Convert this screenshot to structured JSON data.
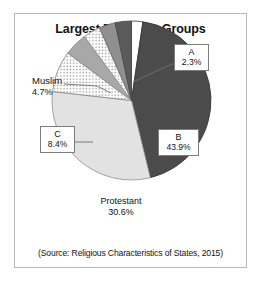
{
  "figure": {
    "title_line1": "Largest Religious Groups",
    "title_line2": "(Rwanda)",
    "source": "(Source: Religious Characteristics of States, 2015)",
    "border_color": "#b9b9b9",
    "background": "#ffffff"
  },
  "labels": {
    "a": {
      "name": "A",
      "value": "2.3%"
    },
    "b": {
      "name": "B",
      "value": "43.9%"
    },
    "c": {
      "name": "C",
      "value": "8.4%"
    },
    "muslim": {
      "name": "Muslim",
      "value": "4.7%"
    },
    "protestant": {
      "name": "Protestant",
      "value": "30.6%"
    }
  },
  "chart_data": {
    "type": "pie",
    "title": "Largest Religious Groups (Rwanda)",
    "subtitle": "(Rwanda)",
    "source": "(Source: Religious Characteristics of States, 2015)",
    "units": "percent",
    "total": 100,
    "legend": "none",
    "labels_position": "callout-boxes-and-leader-lines",
    "start_angle_deg": 0,
    "direction": "clockwise",
    "categories": [
      "A",
      "B",
      "Protestant",
      "C",
      "Muslim",
      "Other 1",
      "Other 2",
      "Other 3"
    ],
    "values": [
      2.3,
      43.9,
      30.6,
      8.4,
      4.7,
      3.5,
      3.3,
      3.3
    ],
    "slices": [
      {
        "label": "A",
        "value": 2.3,
        "display": "2.3%",
        "fill": "#fdfdfd",
        "stroke": "#4f4f4f",
        "pattern": "solid",
        "label_style": "boxed-callout",
        "label_anchor": "upper-right"
      },
      {
        "label": "B",
        "value": 43.9,
        "display": "43.9%",
        "fill": "#4b4b4b",
        "stroke": "#3a3a3a",
        "pattern": "solid",
        "label_style": "boxed-callout",
        "label_anchor": "inside-right"
      },
      {
        "label": "Protestant",
        "value": 30.6,
        "display": "30.6%",
        "fill": "#e2e2e2",
        "stroke": "#9a9a9a",
        "pattern": "solid",
        "label_style": "plain-inside",
        "label_anchor": "inside-bottom-left"
      },
      {
        "label": "C",
        "value": 8.4,
        "display": "8.4%",
        "fill": "#ffffff",
        "stroke": "#8f8f8f",
        "pattern": "dotted",
        "label_style": "boxed-callout",
        "label_anchor": "left"
      },
      {
        "label": "Muslim",
        "value": 4.7,
        "display": "4.7%",
        "fill": "#a8a8a8",
        "stroke": "#8a8a8a",
        "pattern": "solid",
        "label_style": "plain-leader-line",
        "label_anchor": "upper-left"
      },
      {
        "label": "Other 1",
        "value": 3.5,
        "display": "",
        "fill": "#ffffff",
        "stroke": "#8f8f8f",
        "pattern": "dotted",
        "label_style": "none",
        "label_anchor": "none"
      },
      {
        "label": "Other 2",
        "value": 3.3,
        "display": "",
        "fill": "#8f8f8f",
        "stroke": "#6e6e6e",
        "pattern": "solid",
        "label_style": "none",
        "label_anchor": "none"
      },
      {
        "label": "Other 3",
        "value": 3.3,
        "display": "",
        "fill": "#5a5a5a",
        "stroke": "#4a4a4a",
        "pattern": "solid",
        "label_style": "none",
        "label_anchor": "none"
      }
    ]
  }
}
